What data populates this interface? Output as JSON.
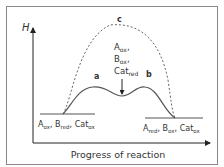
{
  "diagram": {
    "y_axis_label": "H",
    "x_axis_label": "Progress of reaction",
    "curve_labels": {
      "catalysed_peak1": "a",
      "catalysed_peak2": "b",
      "uncatalysed": "c"
    },
    "reactants": {
      "parts": [
        [
          "A",
          "ox"
        ],
        [
          "B",
          "red"
        ],
        [
          "Cat",
          "ox"
        ]
      ]
    },
    "products": {
      "parts": [
        [
          "A",
          "red"
        ],
        [
          "B",
          "ox"
        ],
        [
          "Cat",
          "ox"
        ]
      ]
    },
    "intermediate": {
      "lines": [
        [
          "A",
          "ox"
        ],
        [
          "B",
          "ox"
        ],
        [
          "Cat",
          "red"
        ]
      ]
    },
    "colors": {
      "line": "#555555",
      "frame": "#888888",
      "text": "#333333"
    }
  }
}
